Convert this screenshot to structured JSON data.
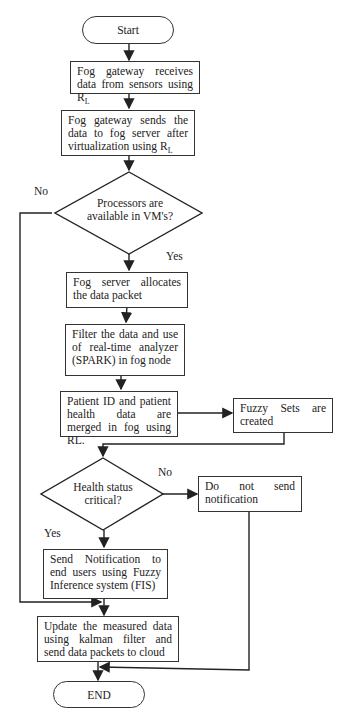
{
  "flowchart": {
    "start": "Start",
    "end": "END",
    "steps": {
      "receive": "Fog gateway receives data from sensors using R",
      "receive_sub": "L",
      "send_server": "Fog gateway sends the data to fog server after virtualization using R",
      "send_server_sub": "L",
      "allocate": "Fog server allocates the data packet",
      "filter": "Filter the data and use of real-time analyzer (SPARK) in fog node",
      "merge": "Patient ID and patient health data are merged in fog using RL.",
      "fuzzy_sets": "Fuzzy Sets are created",
      "no_notify": "Do not send notification",
      "notify": "Send Notification to end users using Fuzzy Inference system (FIS)",
      "update": "Update the measured data using kalman filter and send data packets to cloud"
    },
    "decisions": {
      "processors": "Processors are available in VM's?",
      "health": "Health status critical?"
    },
    "labels": {
      "processors_no": "No",
      "processors_yes": "Yes",
      "health_no": "No",
      "health_yes": "Yes"
    }
  }
}
